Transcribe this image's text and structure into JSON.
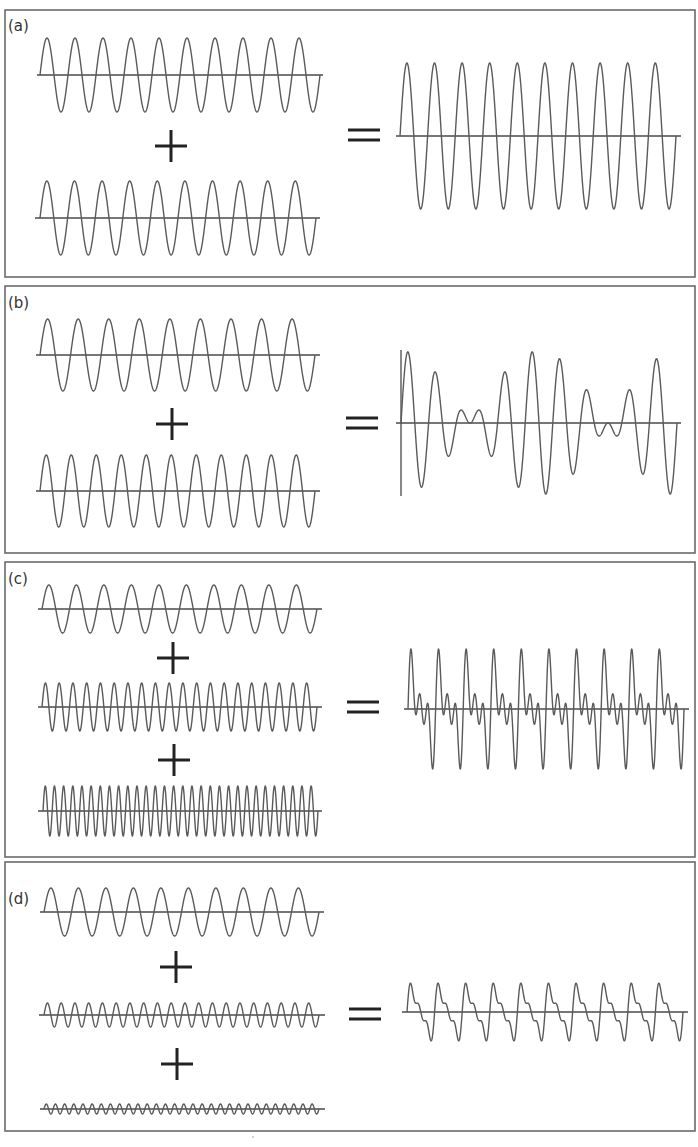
{
  "colors": {
    "wave": "#5a5a5a",
    "axis": "#4a4a4a",
    "operator": "#222222",
    "border": "#6a6a6a"
  },
  "operators": {
    "plus": "+",
    "equals": "="
  },
  "chart_data": [
    {
      "type": "line",
      "label": "(a)",
      "description": "Two identical in-phase sine waves add to a wave of double amplitude (constructive interference)",
      "inputs": [
        {
          "cycles": 10,
          "amplitude": 1
        },
        {
          "cycles": 10,
          "amplitude": 1
        }
      ],
      "result": {
        "formula": "sin(10x) + sin(10x)",
        "cycles": 10,
        "amplitude": 2
      }
    },
    {
      "type": "line",
      "label": "(b)",
      "description": "Two sine waves of slightly different frequency add to produce beats",
      "inputs": [
        {
          "cycles": 9,
          "amplitude": 1
        },
        {
          "cycles": 11,
          "amplitude": 1
        }
      ],
      "result": {
        "formula": "sin(9x) + sin(11x)",
        "beats": 2
      }
    },
    {
      "type": "line",
      "label": "(c)",
      "description": "Fundamental plus 2nd and 3rd harmonics of equal amplitude",
      "inputs": [
        {
          "cycles": 10,
          "amplitude": 1
        },
        {
          "cycles": 20,
          "amplitude": 1
        },
        {
          "cycles": 30,
          "amplitude": 1
        }
      ],
      "result": {
        "formula": "sin(x) + sin(2x) + sin(3x)",
        "cycles": 10
      }
    },
    {
      "type": "line",
      "label": "(d)",
      "description": "Fundamental plus harmonics with amplitudes 1, 1/2, 1/3 approximating a sawtooth",
      "inputs": [
        {
          "cycles": 10,
          "amplitude": 1
        },
        {
          "cycles": 20,
          "amplitude": 0.5
        },
        {
          "cycles": 30,
          "amplitude": 0.333
        }
      ],
      "result": {
        "formula": "sin(x) + sin(2x)/2 + sin(3x)/3",
        "cycles": 10
      }
    }
  ],
  "layout": {
    "panels": [
      {
        "label": "(a)",
        "box": [
          5,
          10,
          690,
          267
        ],
        "labelPos": [
          8,
          31
        ],
        "inputs": [
          {
            "x0": 40,
            "x1": 320,
            "y": 75,
            "amp": 37,
            "axis": [
              37,
              323
            ],
            "terms": [
              [
                10,
                37
              ]
            ]
          },
          {
            "x0": 40,
            "x1": 316,
            "y": 218,
            "amp": 37,
            "axis": [
              35,
              320
            ],
            "terms": [
              [
                10,
                37
              ]
            ]
          }
        ],
        "plus": [
          [
            171,
            146
          ]
        ],
        "equals": [
          364,
          135
        ],
        "result": {
          "x0": 400,
          "x1": 676,
          "y": 136,
          "axis": [
            396,
            681
          ],
          "terms": [
            [
              10,
              73
            ]
          ],
          "vaxis": null
        }
      },
      {
        "label": "(b)",
        "box": [
          5,
          286,
          690,
          267
        ],
        "labelPos": [
          8,
          308
        ],
        "inputs": [
          {
            "x0": 40,
            "x1": 315,
            "y": 355,
            "amp": 36,
            "axis": [
              36,
              320
            ],
            "terms": [
              [
                9,
                36
              ]
            ]
          },
          {
            "x0": 40,
            "x1": 315,
            "y": 491,
            "amp": 36,
            "axis": [
              36,
              320
            ],
            "terms": [
              [
                11,
                36
              ]
            ]
          }
        ],
        "plus": [
          [
            172,
            424
          ]
        ],
        "equals": [
          362,
          423
        ],
        "result": {
          "x0": 401,
          "x1": 677,
          "y": 423,
          "axis": [
            396,
            681
          ],
          "terms": [
            [
              9,
              36
            ],
            [
              11,
              36
            ]
          ],
          "vaxis": [
            401,
            350,
            496
          ]
        }
      },
      {
        "label": "(c)",
        "box": [
          5,
          562,
          690,
          295
        ],
        "labelPos": [
          8,
          584
        ],
        "inputs": [
          {
            "x0": 42,
            "x1": 317,
            "y": 609,
            "amp": 24,
            "axis": [
              38,
              322
            ],
            "terms": [
              [
                10,
                24
              ]
            ]
          },
          {
            "x0": 42,
            "x1": 317,
            "y": 707,
            "amp": 24,
            "axis": [
              38,
              322
            ],
            "terms": [
              [
                20,
                24
              ]
            ]
          },
          {
            "x0": 43,
            "x1": 318,
            "y": 811,
            "amp": 25,
            "axis": [
              38,
              322
            ],
            "terms": [
              [
                30,
                25
              ]
            ]
          }
        ],
        "plus": [
          [
            173,
            658
          ],
          [
            174,
            760
          ]
        ],
        "equals": [
          363,
          707
        ],
        "result": {
          "x0": 408,
          "x1": 684,
          "y": 709,
          "axis": [
            404,
            689
          ],
          "terms": [
            [
              10,
              24
            ],
            [
              20,
              24
            ],
            [
              30,
              24
            ]
          ],
          "vaxis": null
        }
      },
      {
        "label": "(d)",
        "box": [
          5,
          862,
          690,
          269
        ],
        "labelPos": [
          8,
          904
        ],
        "inputs": [
          {
            "x0": 44,
            "x1": 319,
            "y": 912,
            "amp": 24,
            "axis": [
              40,
              324
            ],
            "terms": [
              [
                10,
                24
              ]
            ]
          },
          {
            "x0": 44,
            "x1": 319,
            "y": 1015,
            "amp": 12,
            "axis": [
              39,
              325
            ],
            "terms": [
              [
                20,
                12
              ]
            ]
          },
          {
            "x0": 44,
            "x1": 319,
            "y": 1109,
            "amp": 5,
            "axis": [
              40,
              325
            ],
            "terms": [
              [
                30,
                5
              ]
            ]
          }
        ],
        "plus": [
          [
            176,
            967
          ],
          [
            177,
            1064
          ]
        ],
        "equals": [
          365,
          1014
        ],
        "result": {
          "x0": 407,
          "x1": 683,
          "y": 1012,
          "axis": [
            402,
            688
          ],
          "terms": [
            [
              10,
              20
            ],
            [
              20,
              10
            ],
            [
              30,
              6.7
            ]
          ],
          "vaxis": null
        }
      }
    ]
  }
}
